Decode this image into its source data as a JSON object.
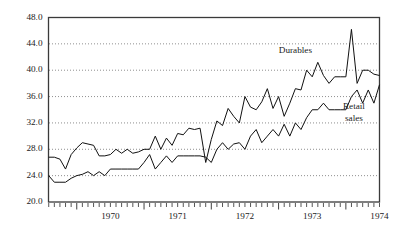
{
  "chart_data": {
    "type": "line",
    "title": "",
    "xlabel": "",
    "ylabel": "",
    "ylim": [
      20.0,
      48.0
    ],
    "ytick_labels": [
      "48.0",
      "44.0",
      "40.0",
      "36.0",
      "32.0",
      "28.0",
      "24.0",
      "20.0"
    ],
    "ytick_values": [
      48.0,
      44.0,
      40.0,
      36.0,
      32.0,
      28.0,
      24.0,
      20.0
    ],
    "grid": "horizontal-dotted",
    "gridline_values": [
      44.0,
      40.0,
      36.0,
      32.0,
      28.0,
      24.0
    ],
    "xtick_labels": [
      "1970",
      "1971",
      "1972",
      "1973",
      "1974"
    ],
    "xtick_values": [
      1970,
      1971,
      1972,
      1973,
      1974
    ],
    "x_minor_ticks": "monthly",
    "x_range": [
      1969.58,
      1974.5
    ],
    "legend_position": "inline-annotations",
    "annotations": [
      {
        "name": "durables-label",
        "text": "Durables",
        "x": 1973.25,
        "y": 43.0
      },
      {
        "name": "retail-sales-label-line1",
        "text": "Retail",
        "x": 1974.12,
        "y": 34.4
      },
      {
        "name": "retail-sales-label-line2",
        "text": "sales",
        "x": 1974.12,
        "y": 32.6
      }
    ],
    "series": [
      {
        "name": "Durables",
        "color": "#111111",
        "x": [
          1969.583,
          1969.667,
          1969.75,
          1969.833,
          1969.917,
          1970.0,
          1970.083,
          1970.167,
          1970.25,
          1970.333,
          1970.417,
          1970.5,
          1970.583,
          1970.667,
          1970.75,
          1970.833,
          1970.917,
          1971.0,
          1971.083,
          1971.167,
          1971.25,
          1971.333,
          1971.417,
          1971.5,
          1971.583,
          1971.667,
          1971.75,
          1971.833,
          1971.917,
          1972.0,
          1972.083,
          1972.167,
          1972.25,
          1972.333,
          1972.417,
          1972.5,
          1972.583,
          1972.667,
          1972.75,
          1972.833,
          1972.917,
          1973.0,
          1973.083,
          1973.167,
          1973.25,
          1973.333,
          1973.417,
          1973.5,
          1973.583,
          1973.667,
          1973.75,
          1973.833,
          1973.917,
          1974.0,
          1974.083,
          1974.167,
          1974.25,
          1974.333,
          1974.417,
          1974.5
        ],
        "values": [
          26.8,
          26.8,
          26.5,
          25.0,
          27.2,
          28.2,
          29.0,
          28.8,
          28.6,
          27.0,
          27.0,
          27.2,
          28.0,
          27.4,
          28.0,
          27.4,
          27.6,
          28.0,
          28.0,
          30.0,
          28.0,
          29.7,
          28.6,
          30.4,
          30.2,
          31.2,
          31.0,
          31.2,
          26.0,
          29.5,
          32.3,
          31.6,
          34.2,
          33.0,
          32.0,
          36.0,
          34.4,
          34.0,
          35.2,
          37.2,
          34.2,
          36.0,
          33.0,
          35.0,
          37.2,
          37.0,
          40.0,
          39.0,
          41.2,
          39.2,
          38.0,
          39.0,
          39.0,
          39.0,
          46.2,
          38.0,
          40.0,
          40.0,
          39.4,
          39.2
        ]
      },
      {
        "name": "Retail sales",
        "color": "#111111",
        "x": [
          1969.583,
          1969.667,
          1969.75,
          1969.833,
          1969.917,
          1970.0,
          1970.083,
          1970.167,
          1970.25,
          1970.333,
          1970.417,
          1970.5,
          1970.583,
          1970.667,
          1970.75,
          1970.833,
          1970.917,
          1971.0,
          1971.083,
          1971.167,
          1971.25,
          1971.333,
          1971.417,
          1971.5,
          1971.583,
          1971.667,
          1971.75,
          1971.833,
          1971.917,
          1972.0,
          1972.083,
          1972.167,
          1972.25,
          1972.333,
          1972.417,
          1972.5,
          1972.583,
          1972.667,
          1972.75,
          1972.833,
          1972.917,
          1973.0,
          1973.083,
          1973.167,
          1973.25,
          1973.333,
          1973.417,
          1973.5,
          1973.583,
          1973.667,
          1973.75,
          1973.833,
          1973.917,
          1974.0,
          1974.083,
          1974.167,
          1974.25,
          1974.333,
          1974.417,
          1974.5
        ],
        "values": [
          24.0,
          23.0,
          23.0,
          23.0,
          23.6,
          24.0,
          24.2,
          24.6,
          24.0,
          24.6,
          24.0,
          25.0,
          25.0,
          25.0,
          25.0,
          25.0,
          25.0,
          26.0,
          27.2,
          25.0,
          26.0,
          27.0,
          26.0,
          27.0,
          27.0,
          27.0,
          27.0,
          27.0,
          26.8,
          26.0,
          28.0,
          29.0,
          28.0,
          28.8,
          29.0,
          28.0,
          30.0,
          31.0,
          29.0,
          30.0,
          31.0,
          30.0,
          31.8,
          30.0,
          32.0,
          31.0,
          32.8,
          34.0,
          34.0,
          35.0,
          34.0,
          34.0,
          34.0,
          34.0,
          36.0,
          37.0,
          35.0,
          37.0,
          35.0,
          37.8
        ]
      }
    ]
  }
}
